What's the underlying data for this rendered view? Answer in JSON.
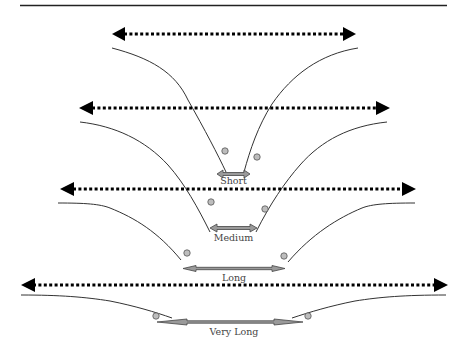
{
  "diagram": {
    "colors": {
      "line": "#222222",
      "curve": "#333333",
      "dotted_arrow": "#000000",
      "range_arrow_fill": "#9a9a9a",
      "range_arrow_stroke": "#444444",
      "circle_fill": "#bdbdbd",
      "circle_stroke": "#555555"
    },
    "levels": [
      {
        "label": "Short"
      },
      {
        "label": "Medium"
      },
      {
        "label": "Long"
      },
      {
        "label": "Very Long"
      }
    ]
  }
}
